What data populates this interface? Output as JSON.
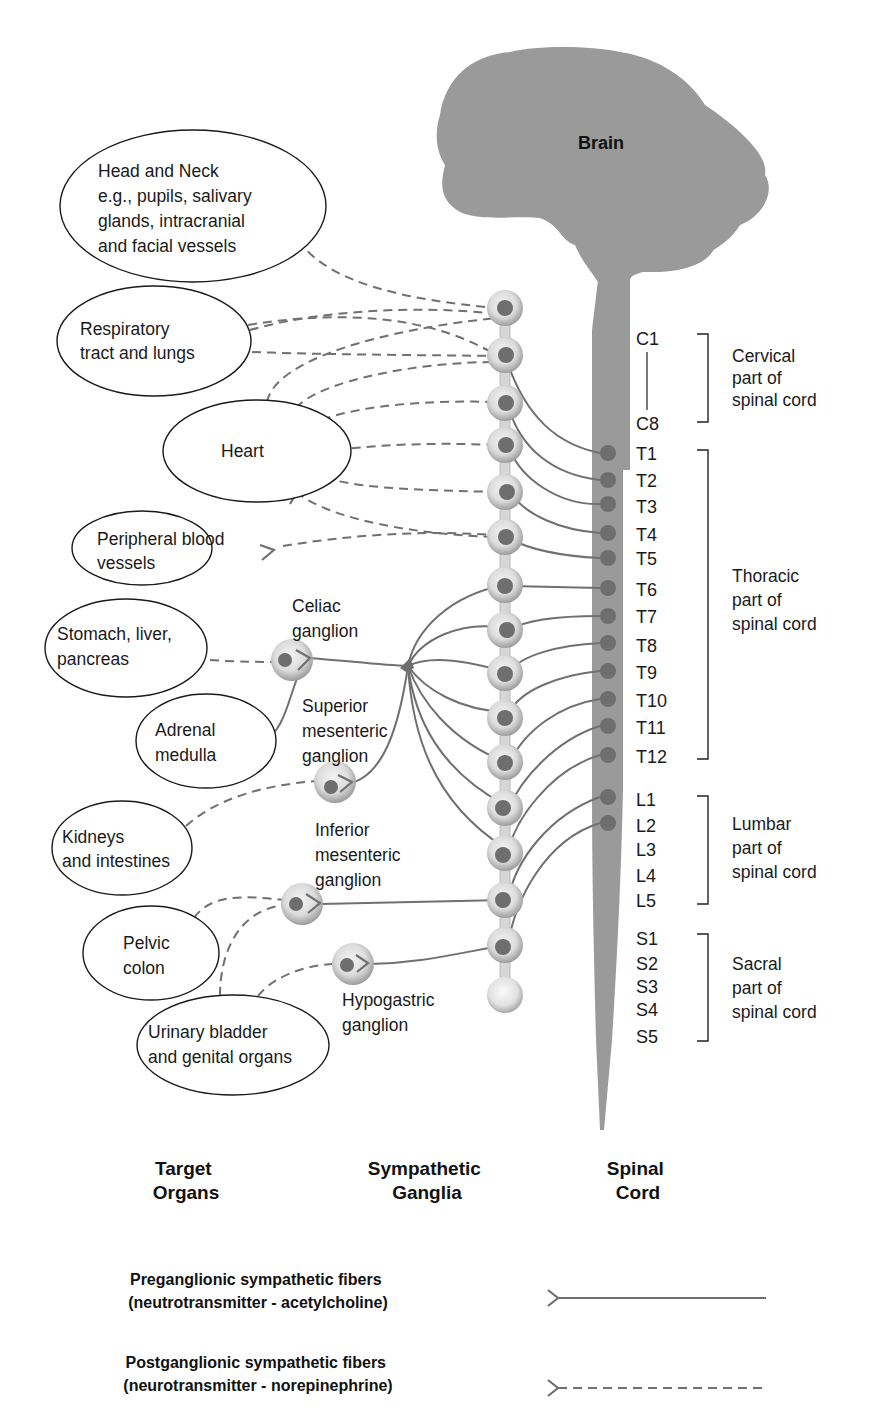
{
  "brain": {
    "label": "Brain",
    "color": "#9a9a9a"
  },
  "spinal_cord": {
    "color": "#9a9a9a",
    "segments": {
      "cervical": [
        "C1",
        "C8"
      ],
      "thoracic": [
        "T1",
        "T2",
        "T3",
        "T4",
        "T5",
        "T6",
        "T7",
        "T8",
        "T9",
        "T10",
        "T11",
        "T12"
      ],
      "lumbar": [
        "L1",
        "L2",
        "L3",
        "L4",
        "L5"
      ],
      "sacral": [
        "S1",
        "S2",
        "S3",
        "S4",
        "S5"
      ]
    },
    "regions": [
      {
        "id": "cervical",
        "lines": [
          "Cervical",
          "part of",
          "spinal cord"
        ]
      },
      {
        "id": "thoracic",
        "lines": [
          "Thoracic",
          "part of",
          "spinal cord"
        ]
      },
      {
        "id": "lumbar",
        "lines": [
          "Lumbar",
          "part of",
          "spinal cord"
        ]
      },
      {
        "id": "sacral",
        "lines": [
          "Sacral",
          "part of",
          "spinal cord"
        ]
      }
    ]
  },
  "target_organs": [
    {
      "id": "head-neck",
      "lines": [
        "Head and Neck",
        "e.g., pupils, salivary",
        "glands, intracranial",
        "and facial vessels"
      ]
    },
    {
      "id": "respiratory",
      "lines": [
        "Respiratory",
        "tract and lungs"
      ]
    },
    {
      "id": "heart",
      "lines": [
        "Heart"
      ]
    },
    {
      "id": "peripheral-vessels",
      "lines": [
        "Peripheral blood",
        "vessels"
      ]
    },
    {
      "id": "stomach-liver-pancreas",
      "lines": [
        "Stomach, liver,",
        "pancreas"
      ]
    },
    {
      "id": "adrenal-medulla",
      "lines": [
        "Adrenal",
        "medulla"
      ]
    },
    {
      "id": "kidneys-intestines",
      "lines": [
        "Kidneys",
        "and intestines"
      ]
    },
    {
      "id": "pelvic-colon",
      "lines": [
        "Pelvic",
        "colon"
      ]
    },
    {
      "id": "bladder-genital",
      "lines": [
        "Urinary bladder",
        "and genital organs"
      ]
    }
  ],
  "collateral_ganglia": [
    {
      "id": "celiac",
      "lines": [
        "Celiac",
        "ganglion"
      ]
    },
    {
      "id": "superior-mesenteric",
      "lines": [
        "Superior",
        "mesenteric",
        "ganglion"
      ]
    },
    {
      "id": "inferior-mesenteric",
      "lines": [
        "Inferior",
        "mesenteric",
        "ganglion"
      ]
    },
    {
      "id": "hypogastric",
      "lines": [
        "Hypogastric",
        "ganglion"
      ]
    }
  ],
  "column_headers": [
    {
      "id": "target-organs",
      "lines": [
        "Target",
        "Organs"
      ]
    },
    {
      "id": "sympathetic-ganglia",
      "lines": [
        "Sympathetic",
        "Ganglia"
      ]
    },
    {
      "id": "spinal-cord",
      "lines": [
        "Spinal",
        "Cord"
      ]
    }
  ],
  "legend": [
    {
      "id": "preganglionic",
      "style": "solid",
      "lines": [
        "Preganglionic sympathetic fibers",
        "(neutrotransmitter - acetylcholine)"
      ]
    },
    {
      "id": "postganglionic",
      "style": "dashed",
      "lines": [
        "Postganglionic sympathetic fibers",
        "(neurotransmitter - norepinephrine)"
      ]
    }
  ],
  "colors": {
    "fiber": "#707070",
    "neuron_body": "#6e6e6e",
    "ganglion_outer": "#c8c8c8",
    "ganglion_inner": "#efefef",
    "outline": "#1a1a1a"
  }
}
